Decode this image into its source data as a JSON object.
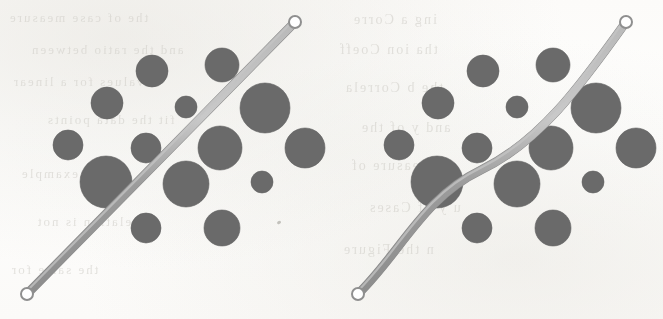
{
  "figure": {
    "width": 663,
    "height": 319,
    "background_color": "#fdfdfc",
    "bubble_color": "#6b6b6b",
    "bubble_stroke": "#5e5e5e",
    "line_color": "#9c9c9c",
    "line_highlight": "#c4c4c4",
    "line_width": 8,
    "endpoint_ring_color": "#8f8f8f",
    "endpoint_ring_fill": "#ffffff"
  },
  "panels": [
    {
      "id": "left",
      "name": "linear-fit-panel",
      "fit_type": "straight",
      "line": {
        "path": "M 27 294 L 295 22",
        "start": [
          27,
          294
        ],
        "end": [
          295,
          22
        ],
        "endpoint_radius": 6
      },
      "bubbles": [
        {
          "cx": 152,
          "cy": 71,
          "r": 16
        },
        {
          "cx": 222,
          "cy": 65,
          "r": 17
        },
        {
          "cx": 107,
          "cy": 103,
          "r": 16
        },
        {
          "cx": 186,
          "cy": 107,
          "r": 11
        },
        {
          "cx": 265,
          "cy": 108,
          "r": 25
        },
        {
          "cx": 68,
          "cy": 145,
          "r": 15
        },
        {
          "cx": 146,
          "cy": 148,
          "r": 15
        },
        {
          "cx": 220,
          "cy": 148,
          "r": 22
        },
        {
          "cx": 305,
          "cy": 148,
          "r": 20
        },
        {
          "cx": 106,
          "cy": 182,
          "r": 26
        },
        {
          "cx": 186,
          "cy": 184,
          "r": 23
        },
        {
          "cx": 262,
          "cy": 182,
          "r": 11
        },
        {
          "cx": 146,
          "cy": 228,
          "r": 15
        },
        {
          "cx": 222,
          "cy": 228,
          "r": 18
        }
      ]
    },
    {
      "id": "right",
      "name": "curved-fit-panel",
      "fit_type": "curved",
      "line": {
        "path": "M 27 294 C 70 252 92 198 150 170 C 208 142 248 88 295 22",
        "start": [
          27,
          294
        ],
        "end": [
          295,
          22
        ],
        "endpoint_radius": 6
      },
      "bubbles": [
        {
          "cx": 152,
          "cy": 71,
          "r": 16
        },
        {
          "cx": 222,
          "cy": 65,
          "r": 17
        },
        {
          "cx": 107,
          "cy": 103,
          "r": 16
        },
        {
          "cx": 186,
          "cy": 107,
          "r": 11
        },
        {
          "cx": 265,
          "cy": 108,
          "r": 25
        },
        {
          "cx": 68,
          "cy": 145,
          "r": 15
        },
        {
          "cx": 146,
          "cy": 148,
          "r": 15
        },
        {
          "cx": 220,
          "cy": 148,
          "r": 22
        },
        {
          "cx": 305,
          "cy": 148,
          "r": 20
        },
        {
          "cx": 106,
          "cy": 182,
          "r": 26
        },
        {
          "cx": 186,
          "cy": 184,
          "r": 23
        },
        {
          "cx": 262,
          "cy": 182,
          "r": 11
        },
        {
          "cx": 146,
          "cy": 228,
          "r": 15
        },
        {
          "cx": 222,
          "cy": 228,
          "r": 18
        }
      ]
    }
  ],
  "chart_data": {
    "type": "scatter",
    "subtitle": "Left: straight-line fit.  Right: curved (non-linear) fit.",
    "xlabel": "",
    "ylabel": "",
    "grid": false,
    "legend": "none",
    "note": "Two side-by-side panels share an identical bubble cloud; only the fitted line differs.",
    "bubble_size_encodes": "magnitude (radius in px, 11-26)",
    "panels": [
      {
        "name": "linear-fit-panel",
        "fit": "straight",
        "points": [
          {
            "x": 152,
            "y": 248,
            "r": 16
          },
          {
            "x": 222,
            "y": 254,
            "r": 17
          },
          {
            "x": 107,
            "y": 216,
            "r": 16
          },
          {
            "x": 186,
            "y": 212,
            "r": 11
          },
          {
            "x": 265,
            "y": 211,
            "r": 25
          },
          {
            "x": 68,
            "y": 174,
            "r": 15
          },
          {
            "x": 146,
            "y": 171,
            "r": 15
          },
          {
            "x": 220,
            "y": 171,
            "r": 22
          },
          {
            "x": 305,
            "y": 171,
            "r": 20
          },
          {
            "x": 106,
            "y": 137,
            "r": 26
          },
          {
            "x": 186,
            "y": 135,
            "r": 23
          },
          {
            "x": 262,
            "y": 137,
            "r": 11
          },
          {
            "x": 146,
            "y": 91,
            "r": 15
          },
          {
            "x": 222,
            "y": 91,
            "r": 18
          }
        ],
        "fit_line": {
          "x": [
            27,
            295
          ],
          "y": [
            25,
            297
          ]
        }
      },
      {
        "name": "curved-fit-panel",
        "fit": "curved",
        "points": [
          {
            "x": 152,
            "y": 248,
            "r": 16
          },
          {
            "x": 222,
            "y": 254,
            "r": 17
          },
          {
            "x": 107,
            "y": 216,
            "r": 16
          },
          {
            "x": 186,
            "y": 212,
            "r": 11
          },
          {
            "x": 265,
            "y": 211,
            "r": 25
          },
          {
            "x": 68,
            "y": 174,
            "r": 15
          },
          {
            "x": 146,
            "y": 171,
            "r": 15
          },
          {
            "x": 220,
            "y": 171,
            "r": 22
          },
          {
            "x": 305,
            "y": 171,
            "r": 20
          },
          {
            "x": 106,
            "y": 137,
            "r": 26
          },
          {
            "x": 186,
            "y": 135,
            "r": 23
          },
          {
            "x": 262,
            "y": 137,
            "r": 11
          },
          {
            "x": 146,
            "y": 91,
            "r": 15
          },
          {
            "x": 222,
            "y": 91,
            "r": 18
          }
        ],
        "fit_line": {
          "x": [
            27,
            85,
            150,
            215,
            295
          ],
          "y": [
            25,
            70,
            149,
            200,
            297
          ]
        }
      }
    ]
  },
  "ghost_text": {
    "description": "faint bleed-through text from the reverse side of the scanned page",
    "color": "#cfcdc7",
    "lines": [
      {
        "text": "the  of  case  measure",
        "left": 8,
        "top": 10,
        "size": 13
      },
      {
        "text": "and  the  ratio  between",
        "left": 30,
        "top": 42,
        "size": 13
      },
      {
        "text": "values  for  a  linear",
        "left": 12,
        "top": 74,
        "size": 13
      },
      {
        "text": "fit  the  data  points",
        "left": 46,
        "top": 112,
        "size": 13
      },
      {
        "text": "in  this  example",
        "left": 20,
        "top": 166,
        "size": 13
      },
      {
        "text": "relation  is  not",
        "left": 36,
        "top": 214,
        "size": 13
      },
      {
        "text": "the  same  for",
        "left": 10,
        "top": 262,
        "size": 13
      },
      {
        "text": "ing  a  Corre",
        "left": 352,
        "top": 12,
        "size": 14
      },
      {
        "text": "tha  ion  Coeff",
        "left": 338,
        "top": 42,
        "size": 14
      },
      {
        "text": "the  b  Correla",
        "left": 344,
        "top": 80,
        "size": 14
      },
      {
        "text": "and  y  of  the",
        "left": 360,
        "top": 120,
        "size": 14
      },
      {
        "text": "a  measure  of",
        "left": 350,
        "top": 158,
        "size": 14
      },
      {
        "text": "u  y  of  Cases",
        "left": 368,
        "top": 200,
        "size": 14
      },
      {
        "text": "n  the  Figure",
        "left": 342,
        "top": 242,
        "size": 14
      }
    ]
  }
}
